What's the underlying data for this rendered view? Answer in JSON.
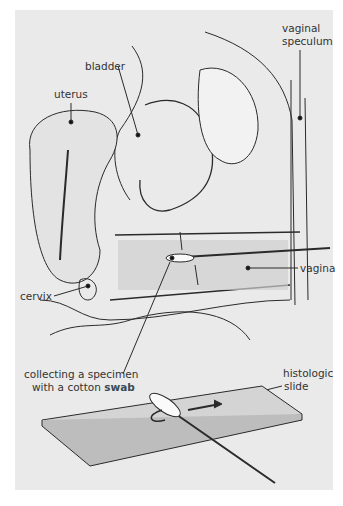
{
  "figure": {
    "labels": {
      "bladder": "bladder",
      "uterus": "uterus",
      "vaginal_speculum_line1": "vaginal",
      "vaginal_speculum_line2": "speculum",
      "cervix": "cervix",
      "vagina": "vagina",
      "collecting_line1": "collecting a specimen",
      "collecting_line2_prefix": "with a cotton",
      "collecting_line2_term": "swab",
      "slide_line1": "histologic",
      "slide_line2": "slide"
    },
    "colors": {
      "background": "#eaeaea",
      "ink": "#2a2a2a",
      "highlight_term": "#3a4a55"
    }
  }
}
